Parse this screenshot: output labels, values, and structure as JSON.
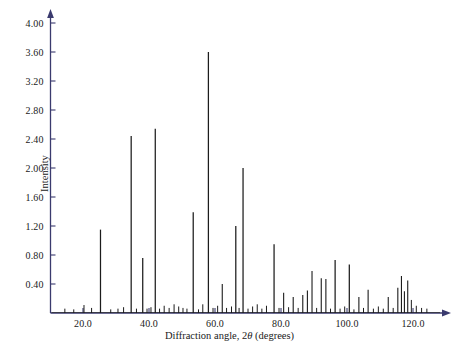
{
  "figure": {
    "background_color": "#ffffff",
    "axis_color": "#3a3a6e",
    "peak_color": "#1c1c1c",
    "text_color": "#1a1a1a"
  },
  "axes": {
    "y_title": "Intensity",
    "x_title_prefix": "Diffraction angle, 2",
    "x_title_symbol": "θ",
    "x_title_suffix": "(degrees)",
    "y_ticks": [
      "0.40",
      "0.80",
      "1.20",
      "1.60",
      "2.00",
      "2.40",
      "2.80",
      "3.20",
      "3.60",
      "4.00"
    ],
    "x_ticks": [
      "20.0",
      "40.0",
      "60.0",
      "80.0",
      "100.0",
      "120.0"
    ]
  },
  "chart_data": {
    "type": "line",
    "title": "",
    "xlabel": "Diffraction angle, 2θ (degrees)",
    "ylabel": "Intensity",
    "xlim": [
      12.0,
      128.0
    ],
    "ylim": [
      0.0,
      4.2
    ],
    "xticks": [
      20.0,
      40.0,
      60.0,
      80.0,
      100.0,
      120.0
    ],
    "yticks": [
      0.4,
      0.8,
      1.2,
      1.6,
      2.0,
      2.4,
      2.8,
      3.2,
      3.6,
      4.0
    ],
    "grid": false,
    "legend": "none",
    "x": [
      14.5,
      17.2,
      20.3,
      22.6,
      25.3,
      28.4,
      30.6,
      32.3,
      34.6,
      36.2,
      38.1,
      39.4,
      40.6,
      41.9,
      43.2,
      44.6,
      46.1,
      47.6,
      49.0,
      50.3,
      51.5,
      53.4,
      55.0,
      56.3,
      58.0,
      59.4,
      60.8,
      62.2,
      63.5,
      65.0,
      66.3,
      67.3,
      68.5,
      70.0,
      71.4,
      72.8,
      74.2,
      75.6,
      77.9,
      79.4,
      80.8,
      82.3,
      83.7,
      85.2,
      86.6,
      88.0,
      89.4,
      90.8,
      92.2,
      93.6,
      95.0,
      96.4,
      97.9,
      99.3,
      100.7,
      102.1,
      103.6,
      105.0,
      106.4,
      108.0,
      109.5,
      111.0,
      112.5,
      114.0,
      115.4,
      116.5,
      117.4,
      118.4,
      119.5,
      121.0,
      122.6,
      124.2
    ],
    "y": [
      0.06,
      0.05,
      0.11,
      0.07,
      1.15,
      0.05,
      0.06,
      0.08,
      2.44,
      0.06,
      0.76,
      0.06,
      0.08,
      2.54,
      0.06,
      0.1,
      0.07,
      0.12,
      0.09,
      0.07,
      0.06,
      1.39,
      0.05,
      0.12,
      3.6,
      0.07,
      0.1,
      0.4,
      0.07,
      0.09,
      1.2,
      0.07,
      2.0,
      0.06,
      0.09,
      0.12,
      0.06,
      0.1,
      0.95,
      0.07,
      0.28,
      0.08,
      0.22,
      0.07,
      0.25,
      0.31,
      0.58,
      0.07,
      0.48,
      0.47,
      0.06,
      0.73,
      0.06,
      0.09,
      0.67,
      0.05,
      0.22,
      0.07,
      0.32,
      0.06,
      0.09,
      0.06,
      0.22,
      0.07,
      0.35,
      0.51,
      0.3,
      0.45,
      0.18,
      0.1,
      0.07,
      0.06
    ],
    "peak_count": 72
  }
}
